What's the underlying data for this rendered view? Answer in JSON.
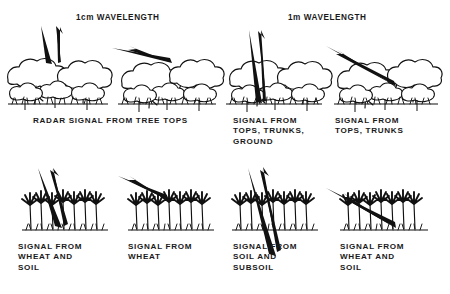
{
  "figure": {
    "title_implicit": "Radar signal interaction with vegetation at two wavelengths",
    "background_color": "#ffffff",
    "ink_color": "#111111"
  },
  "headers": [
    {
      "id": "header-1cm",
      "label": "1cm WAVELENGTH",
      "x": 76,
      "y": 13
    },
    {
      "id": "header-1m",
      "label": "1m WAVELENGTH",
      "x": 288,
      "y": 13
    }
  ],
  "captions": [
    {
      "id": "caption-tree-tops",
      "lines": [
        "RADAR SIGNAL FROM TREE TOPS"
      ],
      "x": 33,
      "y": 116
    },
    {
      "id": "caption-tops-trunks-ground",
      "lines": [
        "SIGNAL FROM",
        "TOPS, TRUNKS,",
        "GROUND"
      ],
      "x": 233,
      "y": 116
    },
    {
      "id": "caption-tops-trunks",
      "lines": [
        "SIGNAL FROM",
        "TOPS, TRUNKS"
      ],
      "x": 335,
      "y": 116
    },
    {
      "id": "caption-wheat-and-soil-1",
      "lines": [
        "SIGNAL FROM",
        "WHEAT AND",
        "SOIL"
      ],
      "x": 18,
      "y": 242
    },
    {
      "id": "caption-wheat",
      "lines": [
        "SIGNAL FROM",
        "WHEAT"
      ],
      "x": 128,
      "y": 242
    },
    {
      "id": "caption-soil-and-subsoil",
      "lines": [
        "SIGNAL FROM",
        "SOIL AND",
        "SUBSOIL"
      ],
      "x": 233,
      "y": 242
    },
    {
      "id": "caption-wheat-and-soil-2",
      "lines": [
        "SIGNAL FROM",
        "WHEAT AND",
        "SOIL"
      ],
      "x": 340,
      "y": 242
    }
  ],
  "panels": [
    {
      "id": "panel-trees-1cm-steep",
      "scene": "forest",
      "wavelength": "1cm",
      "incidence": "steep",
      "interaction": "reflects off tree tops",
      "caption_ref": "caption-tree-tops"
    },
    {
      "id": "panel-trees-1cm-shallow",
      "scene": "forest",
      "wavelength": "1cm",
      "incidence": "shallow",
      "interaction": "reflects off tree tops",
      "caption_ref": "caption-tree-tops"
    },
    {
      "id": "panel-trees-1m-steep",
      "scene": "forest",
      "wavelength": "1m",
      "incidence": "steep",
      "interaction": "penetrates canopy to trunks and ground",
      "caption_ref": "caption-tops-trunks-ground"
    },
    {
      "id": "panel-trees-1m-shallow",
      "scene": "forest",
      "wavelength": "1m",
      "incidence": "shallow",
      "interaction": "penetrates canopy to trunks",
      "caption_ref": "caption-tops-trunks"
    },
    {
      "id": "panel-wheat-1cm-steep",
      "scene": "wheat",
      "wavelength": "1cm",
      "incidence": "steep",
      "interaction": "penetrates heads to soil surface",
      "caption_ref": "caption-wheat-and-soil-1"
    },
    {
      "id": "panel-wheat-1cm-shallow",
      "scene": "wheat",
      "wavelength": "1cm",
      "incidence": "shallow",
      "interaction": "reflects off wheat heads",
      "caption_ref": "caption-wheat"
    },
    {
      "id": "panel-wheat-1m-steep",
      "scene": "wheat",
      "wavelength": "1m",
      "incidence": "steep",
      "interaction": "penetrates through crop and soil into subsoil",
      "caption_ref": "caption-soil-and-subsoil"
    },
    {
      "id": "panel-wheat-1m-shallow",
      "scene": "wheat",
      "wavelength": "1m",
      "incidence": "shallow",
      "interaction": "penetrates wheat to soil surface",
      "caption_ref": "caption-wheat-and-soil-2"
    }
  ]
}
